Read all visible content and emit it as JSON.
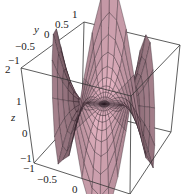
{
  "chart_data": {
    "type": "surface3d",
    "title": "",
    "function": "z = r^3 cos(3θ) (monkey saddle, polar grid)",
    "grid": "polar",
    "box": true,
    "xlabel": "x",
    "ylabel": "y",
    "zlabel": "z",
    "xlim": [
      -1,
      1
    ],
    "ylim": [
      -1,
      1
    ],
    "zlim": [
      -1,
      1
    ],
    "x_ticks": [
      "-1",
      "-0.5",
      "0"
    ],
    "y_ticks": [
      "-1",
      "-0.5",
      "0",
      "0.5",
      "1"
    ],
    "z_ticks": [
      "-1",
      "0",
      "1",
      "2"
    ],
    "surface_color": "#c9a0aa",
    "edge_color": "#2a1a22",
    "box_color": "#333333"
  },
  "labels": {
    "y_axis": "y",
    "z_axis": "z",
    "y_tick_1": "1",
    "y_tick_05": "0.5",
    "y_tick_0": "0",
    "y_tick_m05": "−0.5",
    "y_tick_m1": "−1",
    "z_tick_2": "2",
    "z_tick_1": "1",
    "z_tick_0": "0",
    "z_tick_m1": "−1",
    "x_tick_m1": "−1",
    "x_tick_m05": "−0.5",
    "x_tick_0": "0"
  }
}
